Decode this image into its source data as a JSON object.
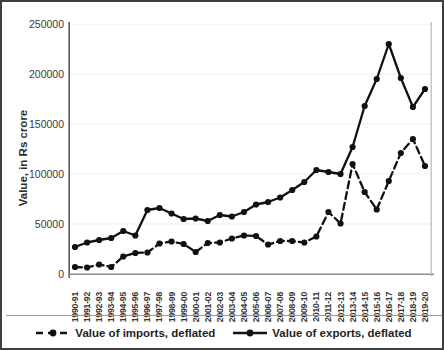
{
  "chart_data": {
    "type": "line",
    "title": "",
    "xlabel": "",
    "ylabel": "Value, in Rs crore",
    "ylim": [
      0,
      250000
    ],
    "yticks": [
      0,
      50000,
      100000,
      150000,
      200000,
      250000
    ],
    "ytick_labels": [
      "0",
      "50000",
      "100000",
      "150000",
      "200000",
      "250000"
    ],
    "grid": true,
    "grid_axis": "y",
    "legend_position": "bottom",
    "categories": [
      "1990-91",
      "1991-92",
      "1992-93",
      "1993-94",
      "1994-95",
      "1995-96",
      "1996-97",
      "1997-98",
      "1998-99",
      "1999-00",
      "2000-01",
      "2001-02",
      "2002-03",
      "2003-04",
      "2004-05",
      "2005-06",
      "2006-07",
      "2007-08",
      "2008-09",
      "2009-10",
      "2010-11",
      "2011-12",
      "2012-13",
      "2013-14",
      "2014-15",
      "2015-16",
      "2016-17",
      "2017-18",
      "2018-19",
      "2019-20"
    ],
    "series": [
      {
        "name": "Value of imports, deflated",
        "style": "dashed",
        "color": "#111111",
        "marker": "circle",
        "values": [
          7000,
          6500,
          9500,
          7000,
          17500,
          21000,
          21500,
          30500,
          32500,
          30000,
          22000,
          31000,
          31500,
          35500,
          38500,
          38000,
          29500,
          33000,
          33000,
          31500,
          37500,
          62000,
          50500,
          110000,
          82000,
          64500,
          93000,
          121000,
          135000,
          108000
        ]
      },
      {
        "name": "Value of exports, deflated",
        "style": "solid",
        "color": "#111111",
        "marker": "circle",
        "values": [
          27000,
          31500,
          34000,
          36000,
          43000,
          38500,
          64000,
          66000,
          60500,
          55000,
          55500,
          53000,
          59000,
          57500,
          62000,
          69500,
          72000,
          76500,
          84000,
          92000,
          104000,
          102000,
          100000,
          127000,
          168000,
          195000,
          230000,
          196000,
          167000,
          172000
        ],
        "note_extra": [
          185000,
          205000
        ]
      }
    ],
    "series_exports_full": [
      27000,
      31500,
      34000,
      36000,
      43000,
      38500,
      64000,
      66000,
      60500,
      55000,
      55500,
      53000,
      59000,
      57500,
      62000,
      69500,
      72000,
      76500,
      84000,
      92000,
      104000,
      102000,
      100000,
      127000,
      168000,
      195000,
      230000,
      196000,
      167000,
      185000
    ]
  },
  "legend": {
    "items": [
      {
        "label": "Value of imports, deflated",
        "style": "dashed"
      },
      {
        "label": "Value of exports, deflated",
        "style": "solid"
      }
    ]
  }
}
